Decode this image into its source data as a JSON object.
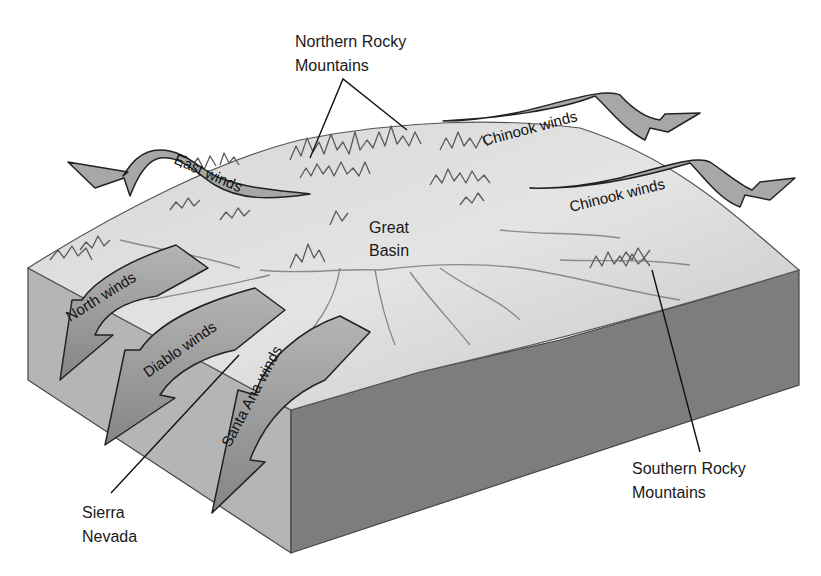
{
  "figure": {
    "type": "block diagram"
  },
  "labels": {
    "northern_rockies": [
      "Northern Rocky",
      "Mountains"
    ],
    "great_basin": [
      "Great",
      "Basin"
    ],
    "sierra_nevada": [
      "Sierra",
      "Nevada"
    ],
    "southern_rockies": [
      "Southern Rocky",
      "Mountains"
    ]
  },
  "winds": {
    "east": "East winds",
    "chinook_upper": "Chinook winds",
    "chinook_lower": "Chinook winds",
    "north": "North winds",
    "diablo": "Diablo winds",
    "santa_ana": "Santa Ana winds"
  },
  "colors": {
    "top_surface": "#d9d9d9",
    "left_face": "#b4b4b4",
    "right_face": "#7c7c7c",
    "arrow_fill": "#9a9a9a",
    "arrow_stroke": "#222222",
    "text": "#1a1a1a"
  }
}
